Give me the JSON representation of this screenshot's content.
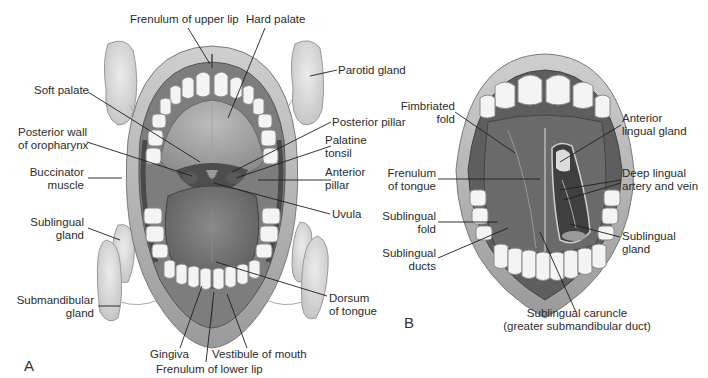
{
  "figure": {
    "panels": [
      {
        "id": "A",
        "letter": "A",
        "view": "Open mouth, oral cavity and salivary glands",
        "labels": {
          "frenulum_upper_lip": "Frenulum of upper lip",
          "hard_palate": "Hard palate",
          "parotid_gland": "Parotid gland",
          "soft_palate": "Soft palate",
          "posterior_pillar": "Posterior pillar",
          "posterior_wall_1": "Posterior wall",
          "posterior_wall_2": "of oropharynx",
          "palatine_tonsil_1": "Palatine",
          "palatine_tonsil_2": "tonsil",
          "buccinator_1": "Buccinator",
          "buccinator_2": "muscle",
          "anterior_pillar_1": "Anterior",
          "anterior_pillar_2": "pillar",
          "uvula": "Uvula",
          "sublingual_gland_1": "Sublingual",
          "sublingual_gland_2": "gland",
          "submandibular_1": "Submandibular",
          "submandibular_2": "gland",
          "dorsum_1": "Dorsum",
          "dorsum_2": "of tongue",
          "gingiva": "Gingiva",
          "vestibule": "Vestibule of mouth",
          "frenulum_lower_lip": "Frenulum of lower lip"
        }
      },
      {
        "id": "B",
        "letter": "B",
        "view": "Underside of tongue",
        "labels": {
          "fimbriated_1": "Fimbriated",
          "fimbriated_2": "fold",
          "anterior_lingual_1": "Anterior",
          "anterior_lingual_2": "lingual gland",
          "frenulum_tongue_1": "Frenulum",
          "frenulum_tongue_2": "of tongue",
          "deep_lingual_1": "Deep lingual",
          "deep_lingual_2": "artery and vein",
          "sublingual_fold_1": "Sublingual",
          "sublingual_fold_2": "fold",
          "sublingual_gland_1": "Sublingual",
          "sublingual_gland_2": "gland",
          "sublingual_ducts_1": "Sublingual",
          "sublingual_ducts_2": "ducts",
          "caruncle_1": "Sublingual caruncle",
          "caruncle_2": "(greater submandibular duct)"
        }
      }
    ],
    "colors": {
      "lip": "#b9b9b9",
      "mucosa": "#8e8e8e",
      "tongue": "#6e6e6e",
      "teeth": "#f4f4f4",
      "gland": "#dcdcdc",
      "leader": "#1e1e1e"
    }
  }
}
